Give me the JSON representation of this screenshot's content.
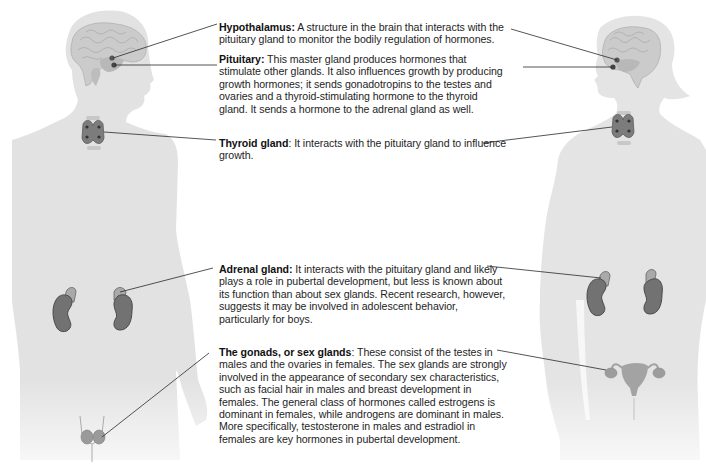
{
  "figure": {
    "figures": [
      {
        "id": "male",
        "label": "male silhouette",
        "glands": [
          "brain-hypothalamus",
          "pituitary",
          "thyroid",
          "adrenal-kidneys",
          "testes"
        ]
      },
      {
        "id": "female",
        "label": "female silhouette",
        "glands": [
          "brain-hypothalamus",
          "pituitary",
          "thyroid",
          "adrenal-kidneys",
          "ovaries-uterus"
        ]
      }
    ],
    "colors": {
      "silhouette": "#e3e3e3",
      "brain": "#c9c9c9",
      "gland_dark": "#6f6f6f",
      "adrenal_light": "#a8a8a8",
      "leader_line": "#2a2a2a",
      "text": "#1e1e1e"
    }
  },
  "annotations": {
    "hypothalamus": {
      "term": "Hypothalamus:",
      "text": " A structure in the brain that interacts with the pituitary gland to monitor the bodily regulation of hormones."
    },
    "pituitary": {
      "term": "Pituitary:",
      "text": " This master gland produces hormones that stimulate other glands. It also influences growth by producing growth hormones; it sends gonadotropins to the testes and ovaries and a thyroid-stimulating hormone to the thyroid gland. It sends a hormone to the adrenal gland as well."
    },
    "thyroid": {
      "term": "Thyroid gland",
      "text": ": It interacts with the pituitary gland to influence growth."
    },
    "adrenal": {
      "term": "Adrenal gland:",
      "text": " It interacts with the pituitary gland and likely plays a role in pubertal development, but less is known about its function than about sex glands. Recent research, however, suggests it may be involved in adolescent behavior, particularly for boys."
    },
    "gonads": {
      "term": "The gonads, or sex glands",
      "text": ": These consist of the testes in males and the ovaries in females. The sex glands are strongly involved in the appearance of secondary sex characteristics, such as facial hair in males and breast development in females. The general class of hormones called estrogens is dominant in females, while androgens are dominant in males. More specifically, testosterone in males and estradiol in females are key hormones in pubertal development."
    }
  }
}
